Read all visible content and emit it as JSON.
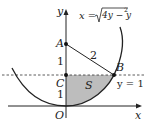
{
  "diagram": {
    "curve_label": "x = √(4y − y²)",
    "curve_label_parts": {
      "lhs": "x =",
      "radicand": "4y − y",
      "exp": "2"
    },
    "axes": {
      "x_label": "x",
      "y_label": "y",
      "origin_label": "O"
    },
    "points": [
      {
        "name": "A",
        "desc": "center (0,2)"
      },
      {
        "name": "B",
        "desc": "intersection of arc and y = 1"
      },
      {
        "name": "C",
        "desc": "(0,1)"
      },
      {
        "name": "O",
        "desc": "origin"
      }
    ],
    "segment_label": "2",
    "unit_labels": {
      "upper": "1",
      "lower": "1"
    },
    "region_label": "S",
    "line_label": "y = 1",
    "colors": {
      "stroke": "#222222",
      "shade": "#bdbdbd",
      "dashed": "#333333"
    }
  }
}
